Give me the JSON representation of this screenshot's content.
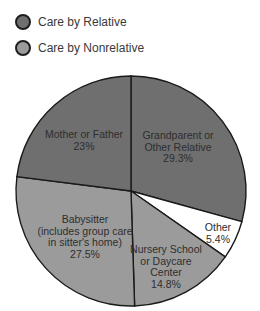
{
  "legend": [
    {
      "label": "Care by Relative",
      "color": "#6f6f6f"
    },
    {
      "label": "Care by Nonrelative",
      "color": "#9b9b9b"
    }
  ],
  "chart_data": {
    "type": "pie",
    "title": "",
    "start_angle_deg": 0,
    "direction": "clockwise",
    "slices": [
      {
        "label": "Grandparent or Other Relative",
        "lines": [
          "Grandparent or",
          "Other Relative",
          "29.3%"
        ],
        "value": 29.3,
        "group": "Care by Relative",
        "color": "#6f6f6f"
      },
      {
        "label": "Other",
        "lines": [
          "Other",
          "5.4%"
        ],
        "value": 5.4,
        "group": "",
        "color": "#ffffff"
      },
      {
        "label": "Nursery School or Daycare Center",
        "lines": [
          "Nursery School",
          "or Daycare",
          "Center",
          "14.8%"
        ],
        "value": 14.8,
        "group": "Care by Nonrelative",
        "color": "#9b9b9b"
      },
      {
        "label": "Babysitter (includes group care in sitter's home)",
        "lines": [
          "Babysitter",
          "(includes group care",
          "in sitter's home)",
          "27.5%"
        ],
        "value": 27.5,
        "group": "Care by Nonrelative",
        "color": "#9b9b9b"
      },
      {
        "label": "Mother or Father",
        "lines": [
          "Mother or Father",
          "23%"
        ],
        "value": 23,
        "group": "Care by Relative",
        "color": "#6f6f6f"
      }
    ],
    "legend_position": "top-left"
  }
}
